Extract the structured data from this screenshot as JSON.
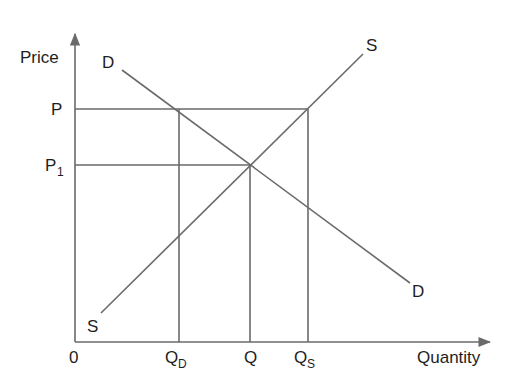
{
  "diagram": {
    "type": "supply-demand",
    "axes": {
      "y_label": "Price",
      "x_label": "Quantity",
      "origin_label": "0"
    },
    "curves": {
      "supply": {
        "label_top": "S",
        "label_bottom": "S"
      },
      "demand": {
        "label_top": "D",
        "label_bottom": "D"
      }
    },
    "price_levels": {
      "p": {
        "label": "P"
      },
      "p1": {
        "label": "P",
        "subscript": "1"
      }
    },
    "quantity_levels": {
      "qd": {
        "label": "Q",
        "subscript": "D"
      },
      "q": {
        "label": "Q"
      },
      "qs": {
        "label": "Q",
        "subscript": "S"
      }
    },
    "colors": {
      "line": "#6a6a6a",
      "text": "#1e1e1e",
      "background": "#ffffff"
    }
  }
}
